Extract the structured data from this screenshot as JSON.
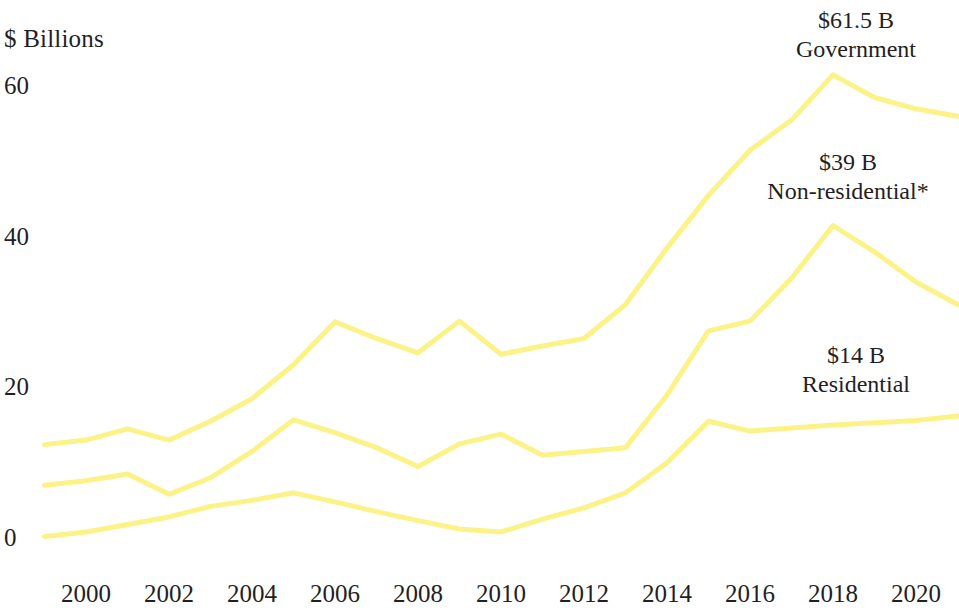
{
  "chart_data": {
    "type": "line",
    "title": "",
    "subtitle": "",
    "xlabel": "",
    "ylabel": "$ Billions",
    "x": [
      1999,
      2000,
      2001,
      2002,
      2003,
      2004,
      2005,
      2006,
      2007,
      2008,
      2009,
      2010,
      2011,
      2012,
      2013,
      2014,
      2015,
      2016,
      2017,
      2018,
      2019,
      2020,
      2021
    ],
    "xticks": [
      2000,
      2002,
      2004,
      2006,
      2008,
      2010,
      2012,
      2014,
      2016,
      2018,
      2020
    ],
    "xtick_labels": [
      "2000",
      "2002",
      "2004",
      "2006",
      "2008",
      "2010",
      "2012",
      "2014",
      "2016",
      "2018",
      "2020"
    ],
    "yticks": [
      0,
      20,
      40,
      60
    ],
    "ytick_labels": [
      "0",
      "20",
      "40",
      "60"
    ],
    "ylim": [
      0,
      66
    ],
    "xlim": [
      1998.8,
      2021.3
    ],
    "grid": false,
    "legend": "inline-annotations",
    "line_color": "#fbf388",
    "line_width": 5,
    "series": [
      {
        "name": "Government",
        "end_label_value": "$61.5 B",
        "end_label_name": "Government",
        "values": [
          12.4,
          13.0,
          14.5,
          13.0,
          15.5,
          18.5,
          23.0,
          28.7,
          26.5,
          24.6,
          28.8,
          24.4,
          25.5,
          26.5,
          31.0,
          38.5,
          45.5,
          51.5,
          55.5,
          61.5,
          58.5,
          57.0,
          56.0
        ]
      },
      {
        "name": "Non-residential*",
        "end_label_value": "$39 B",
        "end_label_name": "Non-residential*",
        "values": [
          7.0,
          7.6,
          8.5,
          5.8,
          8.0,
          11.5,
          15.7,
          14.0,
          12.0,
          9.5,
          12.5,
          13.8,
          11.0,
          11.5,
          12.0,
          19.0,
          27.5,
          28.8,
          34.5,
          41.5,
          38.0,
          34.0,
          31.0
        ]
      },
      {
        "name": "Residential",
        "end_label_value": "$14 B",
        "end_label_name": "Residential",
        "values": [
          0.2,
          0.8,
          1.8,
          2.8,
          4.2,
          5.0,
          6.0,
          4.8,
          3.5,
          2.3,
          1.2,
          0.8,
          2.5,
          4.0,
          6.0,
          10.0,
          15.5,
          14.2,
          14.6,
          15.0,
          15.3,
          15.6,
          16.2
        ]
      }
    ],
    "annotations": [
      {
        "value": "$61.5 B",
        "name": "Government",
        "x_px": 856,
        "y_px": 6
      },
      {
        "value": "$39 B",
        "name": "Non-residential*",
        "x_px": 848,
        "y_px": 148
      },
      {
        "value": "$14 B",
        "name": "Residential",
        "x_px": 856,
        "y_px": 341
      }
    ]
  }
}
